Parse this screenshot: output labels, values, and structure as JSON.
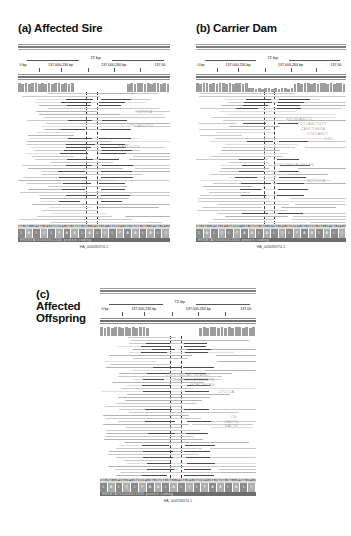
{
  "figure": {
    "type": "genome-browser-alignment-figure",
    "background": "#ffffff",
    "accent_dark": "#4a4a4a",
    "read_color": "#c9c9c9",
    "coverage_color": "#9d9d9d",
    "guide_color": "#3d3d3d"
  },
  "panels": [
    {
      "id": "a",
      "title": "(a) Affected Sire",
      "title_lines": "(a) Affected Sire",
      "ruler": {
        "span_label": "72 bp",
        "ticks": [
          {
            "label": "0 bp",
            "pos": 1.0,
            "align": "lead"
          },
          {
            "label": "137,000,230 bp",
            "pos": 28.0,
            "align": "mid"
          },
          {
            "label": "137,000,260 bp",
            "pos": 63.0,
            "align": "mid"
          },
          {
            "label": "137,00",
            "pos": 97.0,
            "align": "tail"
          }
        ]
      },
      "sequence_letters": "CTGCTGGCACTGCAGCTCCCAGCTGCTCTGCTGGCACTGCAGCTCCCAGCTGCTCTGCTGGCACTGCAGC",
      "amino_acids": [
        "L",
        "A",
        "L",
        "Q",
        "L",
        "P",
        "A",
        "A",
        "L",
        "A",
        "L",
        "Q",
        "L",
        "P",
        "A",
        "A",
        "L",
        "A",
        "L",
        "Q"
      ],
      "gene_label": "ENSBTAT00000012345 protein coding",
      "sample_id": "HA_0040S5974-1",
      "coverage_profile": [
        9,
        8,
        9,
        8,
        9,
        9,
        8,
        9,
        8,
        9,
        8,
        9,
        9,
        8,
        9,
        8,
        9,
        2,
        1,
        1,
        1,
        1,
        1,
        1,
        1,
        1,
        1,
        1,
        1,
        1,
        1,
        1,
        1,
        8,
        9,
        8,
        9,
        9,
        8,
        9,
        8,
        9,
        9,
        8,
        9,
        8
      ],
      "deletion_rows": [
        2,
        3,
        4,
        9,
        12,
        15,
        17,
        18,
        19,
        20,
        22,
        24,
        26,
        28,
        30,
        32,
        34,
        36
      ],
      "mismatch_labels": [
        {
          "text": "CTGCAGCTCC",
          "left": 72,
          "top": 33
        },
        {
          "text": "GAGTCCCG",
          "left": 66,
          "top": 54
        },
        {
          "text": "CCTGCA",
          "left": 78,
          "top": 19
        }
      ]
    },
    {
      "id": "b",
      "title": "(b) Carrier Dam",
      "title_lines": "(b) Carrier Dam",
      "ruler": {
        "span_label": "72 bp",
        "ticks": [
          {
            "label": "0 bp",
            "pos": 1.0,
            "align": "lead"
          },
          {
            "label": "137,000,230 bp",
            "pos": 28.0,
            "align": "mid"
          },
          {
            "label": "137,000,260 bp",
            "pos": 63.0,
            "align": "mid"
          },
          {
            "label": "137,00",
            "pos": 97.0,
            "align": "tail"
          }
        ]
      },
      "sequence_letters": "CTGCTGGCACTGCAGCTCCCAGCTGCTCTGCTGGCACTGCAGCTCCCAGCTGCTCTGCTGGCACTGCAGC",
      "amino_acids": [
        "L",
        "A",
        "L",
        "Q",
        "L",
        "P",
        "A",
        "A",
        "L",
        "A",
        "L",
        "Q",
        "L",
        "P",
        "A",
        "A",
        "L",
        "A",
        "L",
        "Q"
      ],
      "gene_label": "ENSBTAT00000012345 protein coding",
      "sample_id": "HA_0030S5974-1",
      "coverage_profile": [
        9,
        8,
        9,
        9,
        8,
        9,
        8,
        9,
        9,
        8,
        9,
        8,
        9,
        9,
        8,
        9,
        4,
        4,
        3,
        4,
        3,
        4,
        4,
        3,
        4,
        3,
        4,
        4,
        3,
        4,
        8,
        9,
        8,
        9,
        9,
        8,
        9,
        8,
        9,
        9,
        8,
        9,
        8,
        9,
        9,
        8
      ],
      "deletion_rows": [
        2,
        3,
        4,
        5,
        10,
        16,
        22,
        24,
        26,
        28,
        30,
        32,
        34,
        40
      ],
      "mismatch_labels": [
        {
          "text": "GCTGCAGCTC",
          "left": 60,
          "top": 26
        },
        {
          "text": "CTCCCAGCTGCT",
          "left": 66,
          "top": 31
        },
        {
          "text": "CAGCTGGCA",
          "left": 70,
          "top": 36
        },
        {
          "text": "CTGCAGCT",
          "left": 74,
          "top": 41
        },
        {
          "text": "GGC",
          "left": 86,
          "top": 46
        },
        {
          "text": "CTGCTGGCACTGCAG",
          "left": 52,
          "top": 72
        },
        {
          "text": "GCTCCCA",
          "left": 74,
          "top": 88
        }
      ]
    },
    {
      "id": "c",
      "title": "(c)\nAffected\nOffspring",
      "title_lines": "(c)\nAffected\nOffspring",
      "ruler": {
        "span_label": "72 bp",
        "ticks": [
          {
            "label": "0 bp",
            "pos": 1.0,
            "align": "lead"
          },
          {
            "label": "137,000,230 bp",
            "pos": 28.0,
            "align": "mid"
          },
          {
            "label": "137,000,260 bp",
            "pos": 63.0,
            "align": "mid"
          },
          {
            "label": "137,00",
            "pos": 97.0,
            "align": "tail"
          }
        ]
      },
      "sequence_letters": "CTGCTGGCACTGCAGCTCCCAGCTGCTCTGCTGGCACTGCAGCTCCCAGCTGCTCTGCTGGCACTGCAGC",
      "amino_acids": [
        "L",
        "A",
        "L",
        "Q",
        "L",
        "P",
        "A",
        "A",
        "L",
        "A",
        "L",
        "Q",
        "L",
        "P",
        "A",
        "A",
        "L",
        "A",
        "L",
        "Q"
      ],
      "gene_label": "ENSBTAT00000012345 protein coding",
      "sample_id": "HA_0042S4974-1",
      "coverage_profile": [
        9,
        8,
        9,
        8,
        9,
        9,
        8,
        9,
        8,
        9,
        8,
        9,
        9,
        8,
        1,
        1,
        1,
        1,
        1,
        1,
        1,
        1,
        1,
        1,
        1,
        1,
        1,
        1,
        8,
        9,
        8,
        9,
        9,
        8,
        9,
        8,
        9,
        8,
        9,
        9,
        8,
        9,
        8,
        9
      ],
      "deletion_rows": [
        2,
        3,
        4,
        5,
        10,
        12,
        14,
        16,
        18,
        24,
        28,
        32,
        36,
        38,
        40,
        42,
        44,
        46
      ],
      "mismatch_labels": [
        {
          "text": "CTGCTGGCACTGCAGCT",
          "left": 42,
          "top": 38
        },
        {
          "text": "CCCAGCTGCTCTGCTG",
          "left": 46,
          "top": 43
        },
        {
          "text": "GCACTGCAG",
          "left": 58,
          "top": 48
        },
        {
          "text": "CTCCCA",
          "left": 76,
          "top": 55
        },
        {
          "text": "CG",
          "left": 84,
          "top": 80
        },
        {
          "text": "GACTG",
          "left": 80,
          "top": 85
        },
        {
          "text": "GACTG",
          "left": 80,
          "top": 89
        }
      ]
    }
  ]
}
